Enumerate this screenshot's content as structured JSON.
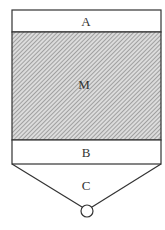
{
  "diagram": {
    "type": "vessel-section",
    "sections": [
      {
        "id": "A",
        "label": "A",
        "fill": "plain"
      },
      {
        "id": "M",
        "label": "M",
        "fill": "hatched"
      },
      {
        "id": "B",
        "label": "B",
        "fill": "plain"
      },
      {
        "id": "C",
        "label": "C",
        "fill": "plain",
        "shape": "funnel"
      }
    ],
    "outlet": {
      "shape": "circle"
    },
    "colors": {
      "stroke": "#333333",
      "hatch": "#777777",
      "hatch_bg": "#dcdcdc"
    }
  }
}
